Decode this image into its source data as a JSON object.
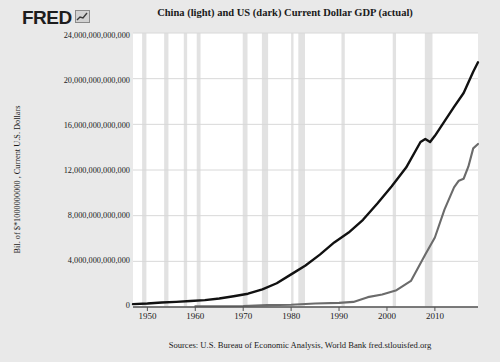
{
  "brand": {
    "logo_text": "FRED",
    "logo_icon": "mini-bar-chart-icon"
  },
  "header": {
    "title": "China (light) and US (dark) Current Dollar GDP (actual)"
  },
  "footer": {
    "source": "Sources: U.S. Bureau of Economic Analysis, World Bank  fred.stlouisfed.org"
  },
  "colors": {
    "background": "#e9e9e9",
    "plot_background": "#ffffff",
    "us_line": "#111111",
    "china_line": "#6b6b6b",
    "gridline": "#d8d8d8",
    "recession_band": "#e2e2e2",
    "axis": "#555555",
    "text": "#1a1a1a"
  },
  "chart_data": {
    "type": "line",
    "title": "China (light) and US (dark) Current Dollar GDP (actual)",
    "xlabel": "",
    "ylabel": "Bil. of $*1000000000 , Current U.S. Dollars",
    "xlim": [
      1947,
      2019
    ],
    "ylim": [
      0,
      24000000000000
    ],
    "grid": true,
    "legend_position": "in-title",
    "ytick_labels": [
      "24,000,000,000,000",
      "20,000,000,000,000",
      "16,000,000,000,000",
      "12,000,000,000,000",
      "8,000,000,000,000",
      "4,000,000,000,000",
      "0"
    ],
    "ytick_values": [
      24000000000000,
      20000000000000,
      16000000000000,
      12000000000000,
      8000000000000,
      4000000000000,
      0
    ],
    "xtick_labels": [
      "1950",
      "1960",
      "1970",
      "1980",
      "1990",
      "2000",
      "2010"
    ],
    "xtick_values": [
      1950,
      1960,
      1970,
      1980,
      1990,
      2000,
      2010
    ],
    "series": [
      {
        "name": "US (dark)",
        "color": "#111111",
        "x": [
          1947,
          1950,
          1953,
          1956,
          1959,
          1962,
          1965,
          1968,
          1971,
          1974,
          1977,
          1980,
          1983,
          1986,
          1989,
          1992,
          1995,
          1998,
          2001,
          2004,
          2007,
          2008,
          2009,
          2010,
          2012,
          2014,
          2016,
          2018,
          2019
        ],
        "values": [
          249600000000,
          300200000000,
          389700000000,
          450100000000,
          522500000000,
          605100000000,
          743700000000,
          942500000000,
          1164800000000,
          1545200000000,
          2081800000000,
          2857300000000,
          3638100000000,
          4590200000000,
          5657700000000,
          6520300000000,
          7639700000000,
          9062800000000,
          10581800000000,
          12213700000000,
          14451900000000,
          14712800000000,
          14448900000000,
          14992100000000,
          16253970000000,
          17527300000000,
          18745100000000,
          20611900000000,
          21433200000000
        ]
      },
      {
        "name": "China (light)",
        "color": "#6b6b6b",
        "x": [
          1960,
          1965,
          1970,
          1975,
          1980,
          1985,
          1990,
          1993,
          1996,
          1999,
          2002,
          2005,
          2008,
          2010,
          2012,
          2014,
          2015,
          2016,
          2017,
          2018,
          2019
        ],
        "values": [
          59716467625,
          70436266147,
          92602973908,
          163431555171,
          191149000000,
          309488000000,
          360857900000,
          444731282346,
          863746650220,
          1094000000000,
          1470550000000,
          2285970000000,
          4594310000000,
          6087160000000,
          8532230000000,
          10475680000000,
          11061550000000,
          11233280000000,
          12310410000000,
          13894820000000,
          14279940000000
        ]
      }
    ],
    "recession_bands": [
      [
        1948.9,
        1949.8
      ],
      [
        1953.5,
        1954.4
      ],
      [
        1957.6,
        1958.3
      ],
      [
        1960.3,
        1961.1
      ],
      [
        1969.9,
        1970.9
      ],
      [
        1973.9,
        1975.2
      ],
      [
        1980.0,
        1980.5
      ],
      [
        1981.5,
        1982.9
      ],
      [
        1990.5,
        1991.2
      ],
      [
        2001.2,
        2001.9
      ],
      [
        2007.9,
        2009.5
      ]
    ]
  }
}
